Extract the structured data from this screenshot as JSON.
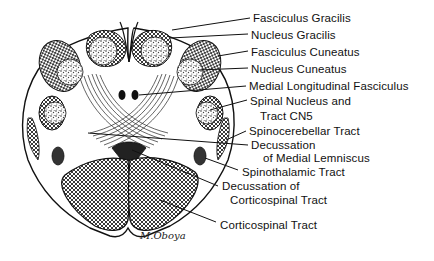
{
  "diagram": {
    "labels": [
      {
        "id": "fasciculus-gracilis",
        "text": "Fasciculus  Gracilis",
        "x": 253,
        "y": 12
      },
      {
        "id": "nucleus-gracilis",
        "text": "Nucleus  Gracilis",
        "x": 251,
        "y": 29
      },
      {
        "id": "fasciculus-cuneatus",
        "text": "Fasciculus  Cuneatus",
        "x": 251,
        "y": 46
      },
      {
        "id": "nucleus-cuneatus",
        "text": "Nucleus  Cuneatus",
        "x": 251,
        "y": 63
      },
      {
        "id": "medial-longitudinal-fasciculus",
        "text": "Medial  Longitudinal  Fasciculus",
        "x": 249,
        "y": 80
      },
      {
        "id": "spinal-nucleus-tract-cn5-line1",
        "text": "Spinal  Nucleus  and",
        "x": 250,
        "y": 95
      },
      {
        "id": "spinal-nucleus-tract-cn5-line2",
        "text": "Tract  CN5",
        "x": 260,
        "y": 110
      },
      {
        "id": "spinocerebellar-tract",
        "text": "Spinocerebellar  Tract",
        "x": 249,
        "y": 125
      },
      {
        "id": "decussation-medial-lemniscus-line1",
        "text": "Decussation",
        "x": 251,
        "y": 139
      },
      {
        "id": "decussation-medial-lemniscus-line2",
        "text": "of  Medial  Lemniscus",
        "x": 263,
        "y": 152
      },
      {
        "id": "spinothalamic-tract",
        "text": "Spinothalamic  Tract",
        "x": 242,
        "y": 166
      },
      {
        "id": "decussation-corticospinal-line1",
        "text": "Decussation  of",
        "x": 222,
        "y": 180
      },
      {
        "id": "decussation-corticospinal-line2",
        "text": "Corticospinal  Tract",
        "x": 230,
        "y": 194
      },
      {
        "id": "corticospinal-tract",
        "text": "Corticospinal  Tract",
        "x": 220,
        "y": 219
      }
    ],
    "signature": "M.Oboya"
  }
}
